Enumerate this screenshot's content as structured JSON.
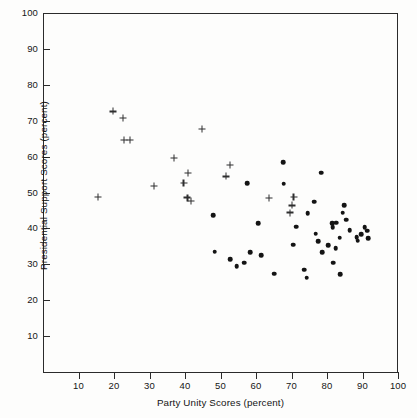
{
  "chart_data": {
    "type": "scatter",
    "title": "",
    "xlabel": "Party Unity Scores (percent)",
    "ylabel": "Presidential Support Scores (percent)",
    "xlim": [
      0,
      100
    ],
    "ylim": [
      0,
      100
    ],
    "xticks": [
      10,
      20,
      30,
      40,
      50,
      60,
      70,
      80,
      90,
      100
    ],
    "yticks": [
      10,
      20,
      30,
      40,
      50,
      60,
      70,
      80,
      90,
      100
    ],
    "grid": false,
    "legend": "none",
    "colors": {
      "marker": "#141414",
      "axis": "#2b2b2b",
      "background": "#fdfdfc"
    },
    "series": [
      {
        "name": "plus-markers",
        "marker": "plus",
        "points": [
          [
            15.5,
            48.8
          ],
          [
            19.7,
            72.6
          ],
          [
            22.6,
            70.8
          ],
          [
            22.8,
            64.6
          ],
          [
            24.6,
            64.6
          ],
          [
            31.3,
            51.8
          ],
          [
            36.9,
            59.6
          ],
          [
            40.8,
            55.4
          ],
          [
            39.6,
            52.6
          ],
          [
            40.7,
            48.6
          ],
          [
            41.6,
            47.6
          ],
          [
            44.8,
            67.7
          ],
          [
            51.6,
            54.5
          ],
          [
            52.6,
            57.6
          ],
          [
            63.6,
            48.5
          ],
          [
            69.6,
            44.4
          ],
          [
            70.6,
            48.8
          ],
          [
            70.2,
            46.4
          ]
        ]
      },
      {
        "name": "dot-markers",
        "marker": "circle",
        "points": [
          [
            47.9,
            43.6
          ],
          [
            48.4,
            33.5
          ],
          [
            52.8,
            31.4
          ],
          [
            54.6,
            29.4
          ],
          [
            56.6,
            30.5
          ],
          [
            57.6,
            52.6
          ],
          [
            58.4,
            33.4
          ],
          [
            60.6,
            41.4
          ],
          [
            61.4,
            32.5
          ],
          [
            65.2,
            27.4
          ],
          [
            67.6,
            58.5
          ],
          [
            67.8,
            52.4
          ],
          [
            70.4,
            35.5
          ],
          [
            71.4,
            40.5
          ],
          [
            73.6,
            28.5
          ],
          [
            74.3,
            26.3
          ],
          [
            74.6,
            44.3
          ],
          [
            76.4,
            47.4
          ],
          [
            76.8,
            38.5
          ],
          [
            77.6,
            36.5
          ],
          [
            78.3,
            55.5
          ],
          [
            78.6,
            33.4
          ],
          [
            80.4,
            35.4
          ],
          [
            81.4,
            41.4
          ],
          [
            81.6,
            40.4
          ],
          [
            81.8,
            30.5
          ],
          [
            82.4,
            34.5
          ],
          [
            82.6,
            41.6
          ],
          [
            83.6,
            37.4
          ],
          [
            83.8,
            27.2
          ],
          [
            84.4,
            44.4
          ],
          [
            84.8,
            46.4
          ],
          [
            85.4,
            42.4
          ],
          [
            86.4,
            39.5
          ],
          [
            88.4,
            37.6
          ],
          [
            88.6,
            36.6
          ],
          [
            89.6,
            38.4
          ],
          [
            90.6,
            40.4
          ],
          [
            91.4,
            39.4
          ],
          [
            91.6,
            37.2
          ]
        ]
      }
    ]
  }
}
